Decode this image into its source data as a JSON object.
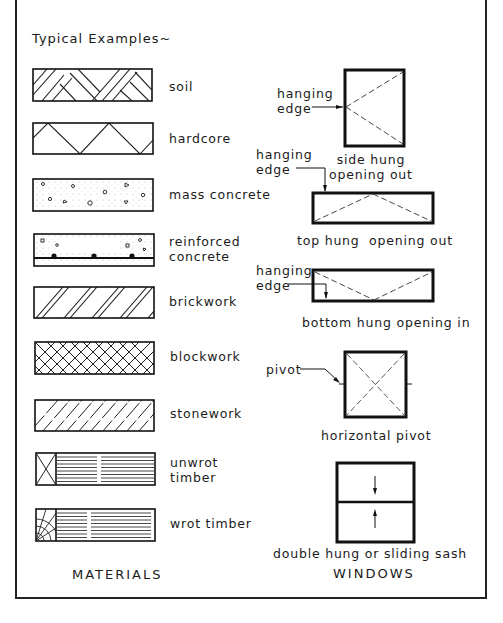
{
  "title": "Typical Examples~",
  "materials": {
    "heading": "MATERIALS",
    "items": [
      {
        "key": "soil",
        "label": "soil"
      },
      {
        "key": "hardcore",
        "label": "hardcore"
      },
      {
        "key": "mass_concrete",
        "label": "mass concrete"
      },
      {
        "key": "reinforced_concrete",
        "label": "reinforced\nconcrete"
      },
      {
        "key": "brickwork",
        "label": "brickwork"
      },
      {
        "key": "blockwork",
        "label": "blockwork"
      },
      {
        "key": "stonework",
        "label": "stonework"
      },
      {
        "key": "unwrot_timber",
        "label": "unwrot\ntimber"
      },
      {
        "key": "wrot_timber",
        "label": "wrot timber"
      }
    ]
  },
  "windows": {
    "heading": "WINDOWS",
    "items": [
      {
        "key": "side_hung",
        "label": "side hung\nopening out",
        "annotation": "hanging\nedge"
      },
      {
        "key": "top_hung",
        "label": "top hung  opening out",
        "annotation": "hanging\nedge"
      },
      {
        "key": "bottom_hung",
        "label": "bottom hung opening in",
        "annotation": "hanging\nedge"
      },
      {
        "key": "horizontal_pivot",
        "label": "horizontal pivot",
        "annotation": "pivot"
      },
      {
        "key": "double_hung",
        "label": "double hung or sliding sash"
      }
    ]
  }
}
